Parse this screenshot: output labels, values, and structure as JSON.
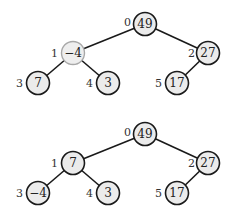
{
  "trees": [
    {
      "name": "before",
      "nodes": [
        {
          "index": "0",
          "value": "49",
          "highlight": false
        },
        {
          "index": "1",
          "value": "−4",
          "highlight": true
        },
        {
          "index": "2",
          "value": "27",
          "highlight": false
        },
        {
          "index": "3",
          "value": "7",
          "highlight": false
        },
        {
          "index": "4",
          "value": "3",
          "highlight": false
        },
        {
          "index": "5",
          "value": "17",
          "highlight": false
        }
      ],
      "edges": [
        [
          0,
          1
        ],
        [
          0,
          2
        ],
        [
          1,
          3
        ],
        [
          1,
          4
        ],
        [
          2,
          5
        ]
      ]
    },
    {
      "name": "after",
      "nodes": [
        {
          "index": "0",
          "value": "49",
          "highlight": false
        },
        {
          "index": "1",
          "value": "7",
          "highlight": false
        },
        {
          "index": "2",
          "value": "27",
          "highlight": false
        },
        {
          "index": "3",
          "value": "−4",
          "highlight": false
        },
        {
          "index": "4",
          "value": "3",
          "highlight": false
        },
        {
          "index": "5",
          "value": "17",
          "highlight": false
        }
      ],
      "edges": [
        [
          0,
          1
        ],
        [
          0,
          2
        ],
        [
          1,
          3
        ],
        [
          1,
          4
        ],
        [
          2,
          5
        ]
      ]
    }
  ]
}
